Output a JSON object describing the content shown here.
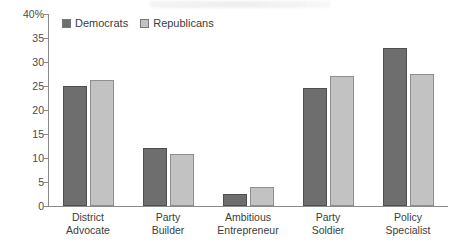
{
  "chart_data": {
    "type": "bar",
    "title": "",
    "xlabel": "",
    "ylabel": "",
    "ylim": [
      0,
      40
    ],
    "ytick_labels": [
      "40%",
      "35",
      "30",
      "25",
      "20",
      "15",
      "10",
      "5",
      "0"
    ],
    "ytick_values": [
      40,
      35,
      30,
      25,
      20,
      15,
      10,
      5,
      0
    ],
    "grid": false,
    "legend_position": "top-left",
    "categories": [
      "District\nAdvocate",
      "Party\nBuilder",
      "Ambitious\nEntrepreneur",
      "Party\nSoldier",
      "Policy\nSpecialist"
    ],
    "series": [
      {
        "name": "Democrats",
        "color": "#6e6e6e",
        "values": [
          25.0,
          12.1,
          2.5,
          24.6,
          32.9
        ]
      },
      {
        "name": "Republicans",
        "color": "#c2c2c2",
        "values": [
          26.3,
          10.8,
          4.0,
          27.1,
          27.4
        ]
      }
    ]
  }
}
